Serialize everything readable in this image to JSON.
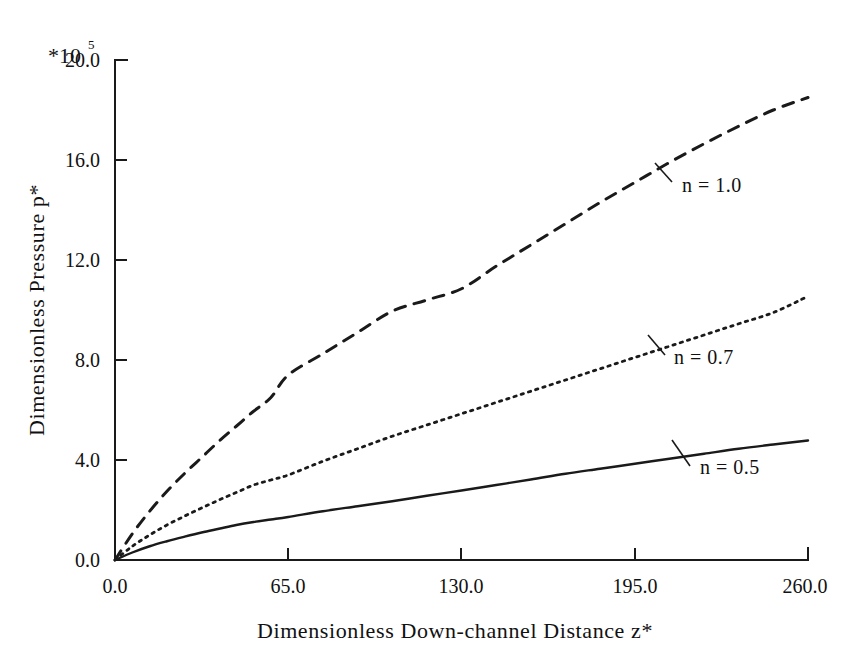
{
  "figure": {
    "multiplier_base": "*10",
    "multiplier_exponent": "5",
    "background_color": "#ffffff",
    "ink_color": "#1a1a1a"
  },
  "chart_data": {
    "type": "line",
    "title": "",
    "subtitle": "",
    "xlabel": "Dimensionless Down-channel Distance z*",
    "ylabel": "Dimensionless Pressure p*",
    "y_multiplier": "*10^5",
    "xlim": [
      0.0,
      260.0
    ],
    "ylim": [
      0.0,
      20.0
    ],
    "xticks": [
      "0.0",
      "65.0",
      "130.0",
      "195.0",
      "260.0"
    ],
    "xtick_values": [
      0,
      65,
      130,
      195,
      260
    ],
    "yticks": [
      "0.0",
      "4.0",
      "8.0",
      "12.0",
      "16.0",
      "20.0"
    ],
    "ytick_values": [
      0,
      4,
      8,
      12,
      16,
      20
    ],
    "grid": false,
    "legend_position": "inline-annotations",
    "x": [
      0,
      6.5,
      13,
      19.5,
      26,
      32.5,
      39,
      45.5,
      52,
      58.5,
      65,
      78,
      91,
      104,
      117,
      130,
      143,
      156,
      169,
      182,
      195,
      208,
      221,
      234,
      247,
      260
    ],
    "series": [
      {
        "name": "n = 1.0",
        "style": "dashed",
        "annotation": "n = 1.0",
        "values": [
          0.0,
          1.05,
          1.95,
          2.75,
          3.45,
          4.1,
          4.75,
          5.35,
          5.95,
          6.5,
          7.4,
          8.25,
          9.1,
          9.95,
          10.4,
          10.85,
          11.75,
          12.6,
          13.45,
          14.3,
          15.1,
          15.9,
          16.65,
          17.35,
          18.0,
          18.5
        ]
      },
      {
        "name": "n = 0.7",
        "style": "dotted",
        "annotation": "n = 0.7",
        "values": [
          0.0,
          0.55,
          1.0,
          1.4,
          1.75,
          2.08,
          2.4,
          2.7,
          3.0,
          3.2,
          3.4,
          3.95,
          4.45,
          4.95,
          5.4,
          5.85,
          6.3,
          6.75,
          7.2,
          7.65,
          8.1,
          8.55,
          9.0,
          9.45,
          9.9,
          10.55
        ]
      },
      {
        "name": "n = 0.5",
        "style": "solid",
        "annotation": "n = 0.5",
        "values": [
          0.0,
          0.3,
          0.55,
          0.75,
          0.93,
          1.1,
          1.25,
          1.4,
          1.52,
          1.62,
          1.72,
          1.95,
          2.15,
          2.35,
          2.57,
          2.78,
          3.0,
          3.22,
          3.45,
          3.65,
          3.85,
          4.05,
          4.25,
          4.45,
          4.62,
          4.78
        ]
      }
    ],
    "annotations": [
      {
        "label": "n = 1.0",
        "x_px": 678,
        "y_px": 185
      },
      {
        "label": "n = 0.7",
        "x_px": 668,
        "y_px": 357
      },
      {
        "label": "n = 0.5",
        "x_px": 700,
        "y_px": 466
      }
    ]
  }
}
